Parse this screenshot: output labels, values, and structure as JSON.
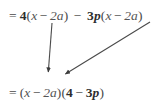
{
  "figure": {
    "background_color": "#ffffff",
    "text_color": "#3a3a3a",
    "arrow_color": "#4a4a4a"
  },
  "equations": {
    "top": {
      "full_text": "= 4(x − 2a) − 3p(x − 2a)",
      "tokens": {
        "equals": "=",
        "coef1": "4",
        "open1": "(",
        "var1": "x",
        "minus1": "−",
        "two_a_1_num": "2",
        "two_a_1_var": "a",
        "close1": ")",
        "minus_mid": "−",
        "coef2_num": "3",
        "coef2_var": "p",
        "open2": "(",
        "var2": "x",
        "minus2": "−",
        "two_a_2_num": "2",
        "two_a_2_var": "a",
        "close2": ")"
      }
    },
    "bottom": {
      "full_text": "= (x − 2a)(4 − 3p)",
      "tokens": {
        "equals": "=",
        "open1": "(",
        "var1": "x",
        "minus1": "−",
        "two_a_num": "2",
        "two_a_var": "a",
        "close1": ")",
        "open2": "(",
        "coef1": "4",
        "minus2": "−",
        "coef2_num": "3",
        "coef2_var": "p",
        "close2": ")"
      }
    }
  },
  "arrows": [
    {
      "name": "arrow-first-binomial",
      "from_x": 52,
      "from_y": 23,
      "to_x": 48,
      "to_y": 76,
      "color": "#4a4a4a",
      "description": "from first (x − 2a) down to factored binomial"
    },
    {
      "name": "arrow-second-binomial",
      "from_x": 150,
      "from_y": 22,
      "to_x": 62,
      "to_y": 76,
      "color": "#4a4a4a",
      "description": "from second (x − 2a) down-left to factored binomial"
    }
  ]
}
